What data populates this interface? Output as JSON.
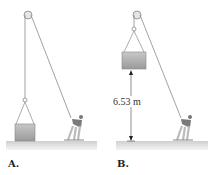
{
  "panels": [
    {
      "label": "A.",
      "description": "Crate resting on ground, lifted by rope over pulley pulled by person"
    },
    {
      "label": "B.",
      "description": "Crate raised above ground by rope over pulley pulled by person",
      "height_label": "6.53 m"
    }
  ],
  "colors": {
    "rope": "#8a8a8a",
    "ground": "#d9d9d9",
    "crate": "#a9a9a9",
    "label": "#222222"
  }
}
